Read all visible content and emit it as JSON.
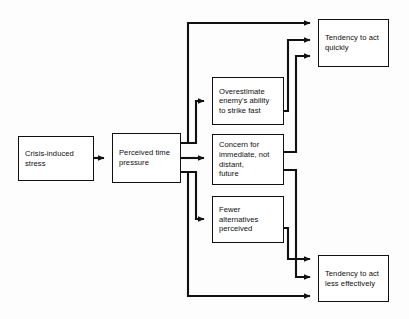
{
  "diagram": {
    "type": "flowchart",
    "background_color": "#fdfdfd",
    "line_color": "#111111",
    "box_fill_color": "#ffffff",
    "nodes": [
      {
        "id": "crisis-stress",
        "label": "Crisis-induced\nstress"
      },
      {
        "id": "perceived-time",
        "label": "Perceived time\npressure"
      },
      {
        "id": "overestimate-enemy",
        "label": "Overestimate\nenemy's ability\nto strike fast"
      },
      {
        "id": "concern-immediate",
        "label": "Concern for\nimmediate, not\ndistant,\nfuture"
      },
      {
        "id": "fewer-alternatives",
        "label": "Fewer\nalternatives\nperceived"
      },
      {
        "id": "act-quickly",
        "label": "Tendency to act\nquickly"
      },
      {
        "id": "act-less-effective",
        "label": "Tendency to act\nless effectively"
      }
    ],
    "edges": [
      {
        "from": "crisis-stress",
        "to": "perceived-time"
      },
      {
        "from": "perceived-time",
        "to": "overestimate-enemy"
      },
      {
        "from": "perceived-time",
        "to": "concern-immediate"
      },
      {
        "from": "perceived-time",
        "to": "fewer-alternatives"
      },
      {
        "from": "perceived-time",
        "to": "act-quickly"
      },
      {
        "from": "perceived-time",
        "to": "act-less-effective"
      },
      {
        "from": "overestimate-enemy",
        "to": "act-quickly"
      },
      {
        "from": "concern-immediate",
        "to": "act-quickly"
      },
      {
        "from": "concern-immediate",
        "to": "act-less-effective"
      },
      {
        "from": "fewer-alternatives",
        "to": "act-less-effective"
      }
    ]
  }
}
